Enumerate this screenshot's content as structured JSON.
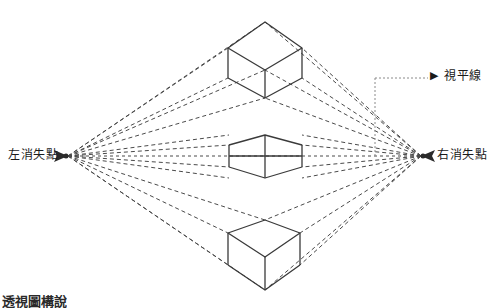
{
  "diagram": {
    "title_caption": "透視圖構說",
    "labels": {
      "left_vp": "左消失點",
      "right_vp": "右消失點",
      "horizon": "視平線",
      "horizon_arrow_glyph": "▶"
    },
    "colors": {
      "line": "#3a3a3a",
      "dashed": "#4a4a4a",
      "background": "#ffffff",
      "text": "#1a1a1a"
    },
    "geometry": {
      "left_vanishing_point": [
        68,
        156
      ],
      "right_vanishing_point": [
        421,
        156
      ],
      "horizon_y": 156,
      "leader_vertical_x": 375,
      "leader_top_y": 78,
      "cubes": [
        {
          "name": "upper-cube",
          "position": "above-horizon",
          "top_apex": [
            265,
            22
          ],
          "left_corner": [
            228,
            48
          ],
          "right_corner": [
            302,
            48
          ],
          "center_corner": [
            265,
            70
          ],
          "left_bottom": [
            228,
            78
          ],
          "right_bottom": [
            302,
            78
          ],
          "bottom_apex": [
            265,
            98
          ]
        },
        {
          "name": "middle-box",
          "position": "on-horizon",
          "left": 229,
          "right": 302,
          "top": 135,
          "bottom": 178,
          "center_x": 265
        },
        {
          "name": "lower-cube",
          "position": "below-horizon",
          "top_apex": [
            265,
            220
          ],
          "left_corner": [
            228,
            233
          ],
          "right_corner": [
            300,
            233
          ],
          "center_corner": [
            265,
            257
          ],
          "left_bottom": [
            228,
            265
          ],
          "right_bottom": [
            300,
            265
          ],
          "bottom_apex": [
            265,
            290
          ]
        }
      ],
      "convergence_targets_left": [
        [
          228,
          48
        ],
        [
          265,
          22
        ],
        [
          265,
          70
        ],
        [
          228,
          78
        ],
        [
          265,
          98
        ],
        [
          229,
          135
        ],
        [
          229,
          145
        ],
        [
          229,
          167
        ],
        [
          229,
          178
        ],
        [
          228,
          220
        ],
        [
          228,
          233
        ],
        [
          265,
          220
        ],
        [
          228,
          265
        ],
        [
          265,
          290
        ]
      ],
      "convergence_targets_right": [
        [
          302,
          48
        ],
        [
          265,
          22
        ],
        [
          265,
          70
        ],
        [
          302,
          78
        ],
        [
          265,
          98
        ],
        [
          302,
          135
        ],
        [
          302,
          145
        ],
        [
          302,
          167
        ],
        [
          302,
          178
        ],
        [
          300,
          220
        ],
        [
          300,
          233
        ],
        [
          265,
          220
        ],
        [
          300,
          265
        ],
        [
          265,
          290
        ]
      ]
    }
  }
}
